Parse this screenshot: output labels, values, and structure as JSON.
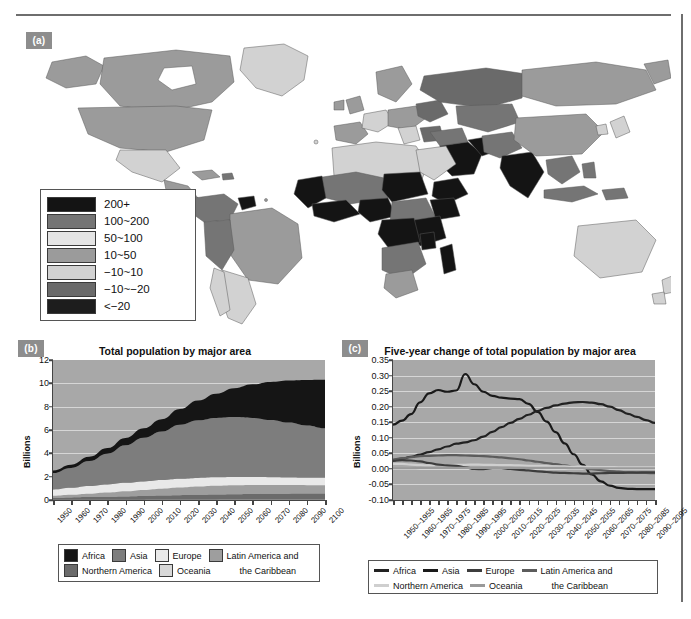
{
  "figure": {
    "panels": [
      {
        "tag": "(a)",
        "name": "world-map"
      },
      {
        "tag": "(b)",
        "name": "total-population-area-chart"
      },
      {
        "tag": "(c)",
        "name": "five-year-change-line-chart"
      }
    ]
  },
  "map": {
    "tag": "(a)",
    "legend": {
      "name": "map-legend",
      "entries": [
        {
          "label": "200+",
          "color": "#141414"
        },
        {
          "label": "100~200",
          "color": "#757575"
        },
        {
          "label": "50~100",
          "color": "#e4e4e4"
        },
        {
          "label": "10~50",
          "color": "#9b9b9b"
        },
        {
          "label": "−10~10",
          "color": "#d2d2d2"
        },
        {
          "label": "−10~−20",
          "color": "#6a6a6a"
        },
        {
          "label": "<−20",
          "color": "#1d1d1d"
        }
      ]
    },
    "ocean_color": "#ffffff",
    "border_color": "#5a5a5a"
  },
  "chart_b": {
    "tag": "(b)",
    "title": "Total population by major area",
    "ylabel": "Billions"
  },
  "chart_c": {
    "tag": "(c)",
    "title": "Five-year change of total population by major area",
    "ylabel": "Billions"
  },
  "chart_data": [
    {
      "type": "area",
      "name": "total-population-by-major-area",
      "title": "Total population by major area",
      "xlabel": "",
      "ylabel": "Billions",
      "ylim": [
        0,
        12
      ],
      "yticks": [
        0,
        2,
        4,
        6,
        8,
        10,
        12
      ],
      "grid": true,
      "legend_position": "bottom",
      "stacked": true,
      "categories": [
        "1950",
        "1960",
        "1970",
        "1980",
        "1990",
        "2000",
        "2010",
        "2020",
        "2030",
        "2040",
        "2050",
        "2060",
        "2070",
        "2080",
        "2090",
        "2100"
      ],
      "series": [
        {
          "name": "Oceania",
          "color": "#8a8a8a",
          "values": [
            0.013,
            0.016,
            0.02,
            0.023,
            0.027,
            0.031,
            0.037,
            0.043,
            0.048,
            0.053,
            0.057,
            0.06,
            0.063,
            0.065,
            0.066,
            0.067
          ]
        },
        {
          "name": "Northern America",
          "color": "#6b6b6b",
          "values": [
            0.173,
            0.205,
            0.231,
            0.254,
            0.28,
            0.313,
            0.343,
            0.369,
            0.395,
            0.417,
            0.435,
            0.45,
            0.463,
            0.475,
            0.485,
            0.5
          ]
        },
        {
          "name": "Latin America and the Caribbean",
          "color": "#9e9e9e",
          "values": [
            0.169,
            0.22,
            0.287,
            0.362,
            0.443,
            0.522,
            0.591,
            0.654,
            0.706,
            0.743,
            0.762,
            0.766,
            0.758,
            0.742,
            0.721,
            0.7
          ]
        },
        {
          "name": "Europe",
          "color": "#e9e9e9",
          "values": [
            0.549,
            0.605,
            0.657,
            0.694,
            0.721,
            0.727,
            0.736,
            0.748,
            0.741,
            0.728,
            0.71,
            0.69,
            0.67,
            0.652,
            0.64,
            0.63
          ]
        },
        {
          "name": "Asia",
          "color": "#7d7d7d",
          "values": [
            1.404,
            1.7,
            2.142,
            2.642,
            3.221,
            3.741,
            4.17,
            4.641,
            4.947,
            5.098,
            5.142,
            5.073,
            4.911,
            4.703,
            4.481,
            4.26
          ]
        },
        {
          "name": "Africa",
          "color": "#151515",
          "values": [
            0.229,
            0.285,
            0.366,
            0.478,
            0.631,
            0.814,
            1.044,
            1.341,
            1.688,
            2.077,
            2.478,
            2.874,
            3.255,
            3.599,
            3.89,
            4.14
          ]
        }
      ],
      "legend_entries": [
        "Africa",
        "Asia",
        "Europe",
        "Latin America and the Caribbean",
        "Northern America",
        "Oceania"
      ],
      "total_at_last_point": 11.2,
      "total_at_first_point": 2.54
    },
    {
      "type": "line",
      "name": "five-year-change-of-total-population-by-major-area",
      "title": "Five-year change of total population by major area",
      "xlabel": "",
      "ylabel": "Billions",
      "ylim": [
        -0.1,
        0.35
      ],
      "yticks": [
        -0.1,
        -0.05,
        0.0,
        0.05,
        0.1,
        0.15,
        0.2,
        0.25,
        0.3,
        0.35
      ],
      "grid": true,
      "legend_position": "bottom",
      "categories": [
        "1950–1955",
        "1955–1960",
        "1960–1965",
        "1965–1970",
        "1970–1975",
        "1975–1980",
        "1980–1985",
        "1985–1990",
        "1990–1995",
        "1995–2000",
        "2000–2005",
        "2005–2010",
        "2010–2015",
        "2015–2020",
        "2020–2025",
        "2025–2030",
        "2030–2035",
        "2035–2040",
        "2040–2045",
        "2045–2050",
        "2050–2055",
        "2055–2060",
        "2060–2065",
        "2065–2070",
        "2070–2075",
        "2075–2080",
        "2080–2085",
        "2085–2090",
        "2090–2095",
        "2095–2100"
      ],
      "xtick_labels": [
        "1950–1955",
        "1960–1965",
        "1970–1975",
        "1980–1985",
        "1990–1995",
        "2000–2005",
        "2010–2015",
        "2020–2025",
        "2030–2035",
        "2040–2045",
        "2050–2055",
        "2060–2065",
        "2070–2075",
        "2080–2085",
        "2090–2095"
      ],
      "series": [
        {
          "name": "Asia",
          "color": "#1a1a1a",
          "values": [
            0.142,
            0.155,
            0.176,
            0.214,
            0.243,
            0.253,
            0.248,
            0.252,
            0.305,
            0.272,
            0.248,
            0.235,
            0.229,
            0.226,
            0.224,
            0.209,
            0.183,
            0.152,
            0.118,
            0.082,
            0.047,
            0.013,
            -0.018,
            -0.04,
            -0.054,
            -0.061,
            -0.064,
            -0.065,
            -0.065,
            -0.065
          ]
        },
        {
          "name": "Africa",
          "color": "#222222",
          "values": [
            0.028,
            0.033,
            0.039,
            0.046,
            0.054,
            0.063,
            0.072,
            0.081,
            0.085,
            0.092,
            0.104,
            0.119,
            0.134,
            0.148,
            0.161,
            0.174,
            0.186,
            0.196,
            0.204,
            0.21,
            0.214,
            0.215,
            0.213,
            0.208,
            0.2,
            0.189,
            0.177,
            0.167,
            0.157,
            0.148
          ]
        },
        {
          "name": "Latin America and the Caribbean",
          "color": "#5c5c5c",
          "values": [
            0.03,
            0.034,
            0.038,
            0.041,
            0.042,
            0.043,
            0.044,
            0.044,
            0.043,
            0.042,
            0.041,
            0.039,
            0.037,
            0.034,
            0.031,
            0.027,
            0.023,
            0.019,
            0.015,
            0.011,
            0.007,
            0.003,
            -0.001,
            -0.004,
            -0.007,
            -0.009,
            -0.011,
            -0.012,
            -0.013,
            -0.014
          ]
        },
        {
          "name": "Northern America",
          "color": "#cfcfcf",
          "values": [
            0.016,
            0.016,
            0.014,
            0.012,
            0.011,
            0.012,
            0.012,
            0.013,
            0.013,
            0.014,
            0.013,
            0.013,
            0.012,
            0.012,
            0.011,
            0.01,
            0.01,
            0.009,
            0.008,
            0.008,
            0.007,
            0.007,
            0.006,
            0.006,
            0.006,
            0.005,
            0.005,
            0.005,
            0.005,
            0.005
          ]
        },
        {
          "name": "Europe",
          "color": "#3d3d3d",
          "values": [
            0.026,
            0.028,
            0.027,
            0.024,
            0.019,
            0.014,
            0.011,
            0.01,
            0.005,
            0.0,
            -0.001,
            0.002,
            0.002,
            0.0,
            -0.003,
            -0.005,
            -0.008,
            -0.01,
            -0.012,
            -0.013,
            -0.014,
            -0.015,
            -0.015,
            -0.014,
            -0.013,
            -0.013,
            -0.012,
            -0.012,
            -0.011,
            -0.011
          ]
        },
        {
          "name": "Oceania",
          "color": "#9a9a9a",
          "values": [
            0.002,
            0.002,
            0.002,
            0.003,
            0.003,
            0.003,
            0.003,
            0.003,
            0.003,
            0.003,
            0.003,
            0.003,
            0.003,
            0.003,
            0.003,
            0.003,
            0.003,
            0.003,
            0.003,
            0.003,
            0.002,
            0.002,
            0.002,
            0.002,
            0.002,
            0.002,
            0.002,
            0.002,
            0.002,
            0.002
          ]
        }
      ],
      "legend_entries": [
        "Africa",
        "Asia",
        "Europe",
        "Latin America and the Caribbean",
        "Northern America",
        "Oceania"
      ],
      "peak_asia": 0.305,
      "peak_africa": 0.215
    }
  ],
  "chart_b_xticks": [
    "1950",
    "1960",
    "1970",
    "1980",
    "1990",
    "2000",
    "2010",
    "2020",
    "2030",
    "2040",
    "2050",
    "2060",
    "2070",
    "2080",
    "2090",
    "2100"
  ],
  "legend_b": {
    "row1": [
      {
        "label": "Africa",
        "color": "#151515"
      },
      {
        "label": "Asia",
        "color": "#7d7d7d"
      },
      {
        "label": "Europe",
        "color": "#e9e9e9"
      },
      {
        "label": "Latin America and",
        "color": "#9e9e9e"
      }
    ],
    "row2": [
      {
        "label": "Northern America",
        "color": "#6b6b6b"
      },
      {
        "label": "Oceania",
        "color": "#d8d8d8"
      },
      {
        "label": "the Caribbean",
        "color": null
      }
    ]
  },
  "legend_c": {
    "row1": [
      {
        "label": "Africa",
        "color": "#222222"
      },
      {
        "label": "Asia",
        "color": "#1a1a1a"
      },
      {
        "label": "Europe",
        "color": "#3d3d3d"
      },
      {
        "label": "Latin America and",
        "color": "#5c5c5c"
      }
    ],
    "row2": [
      {
        "label": "Northern America",
        "color": "#cfcfcf"
      },
      {
        "label": "Oceania",
        "color": "#9a9a9a"
      },
      {
        "label": "the Caribbean",
        "color": null
      }
    ]
  }
}
